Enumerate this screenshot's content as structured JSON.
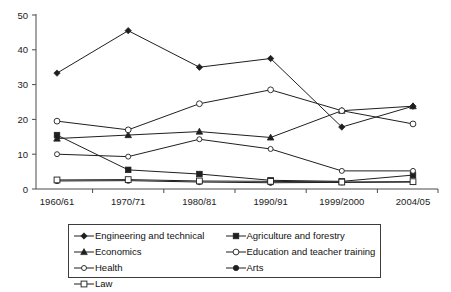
{
  "chart_data": {
    "type": "line",
    "title": "",
    "xlabel": "",
    "ylabel": "",
    "ylim": [
      0,
      50
    ],
    "yticks": [
      0,
      10,
      20,
      30,
      40,
      50
    ],
    "grid": false,
    "legend_position": "bottom",
    "categories": [
      "1960/61",
      "1970/71",
      "1980/81",
      "1990/91",
      "1999/2000",
      "2004/05"
    ],
    "series": [
      {
        "name": "Engineering and technical",
        "marker": "filled-diamond",
        "values": [
          33.3,
          45.5,
          35.0,
          37.5,
          17.8,
          23.8
        ]
      },
      {
        "name": "Agriculture and forestry",
        "marker": "filled-square",
        "values": [
          15.5,
          5.5,
          4.3,
          2.5,
          2.2,
          4.0
        ]
      },
      {
        "name": "Economics",
        "marker": "filled-triangle",
        "values": [
          14.5,
          15.5,
          16.5,
          14.8,
          22.5,
          23.8
        ]
      },
      {
        "name": "Education and teacher training",
        "marker": "open-circle",
        "values": [
          19.5,
          17.0,
          24.5,
          28.5,
          22.5,
          18.7
        ]
      },
      {
        "name": "Health",
        "marker": "open-circle-small",
        "values": [
          10.0,
          9.3,
          14.3,
          11.5,
          5.2,
          5.2
        ]
      },
      {
        "name": "Arts",
        "marker": "filled-circle",
        "values": [
          2.3,
          2.4,
          2.0,
          1.8,
          1.9,
          2.0
        ]
      },
      {
        "name": "Law",
        "marker": "open-square",
        "values": [
          2.6,
          2.7,
          2.3,
          2.2,
          2.0,
          2.1
        ]
      }
    ]
  },
  "legend": {
    "entries": [
      {
        "label": "Engineering and technical",
        "marker": "filled-diamond"
      },
      {
        "label": "Agriculture and forestry",
        "marker": "filled-square"
      },
      {
        "label": "Economics",
        "marker": "filled-triangle"
      },
      {
        "label": "Education and teacher training",
        "marker": "open-circle"
      },
      {
        "label": "Health",
        "marker": "open-circle-small"
      },
      {
        "label": "Arts",
        "marker": "filled-circle"
      },
      {
        "label": "Law",
        "marker": "open-square"
      }
    ]
  },
  "colors": {
    "line": "#1f1f1f",
    "axis": "#4a4a4a",
    "background": "#ffffff",
    "legend_border": "#3c3c3c"
  }
}
